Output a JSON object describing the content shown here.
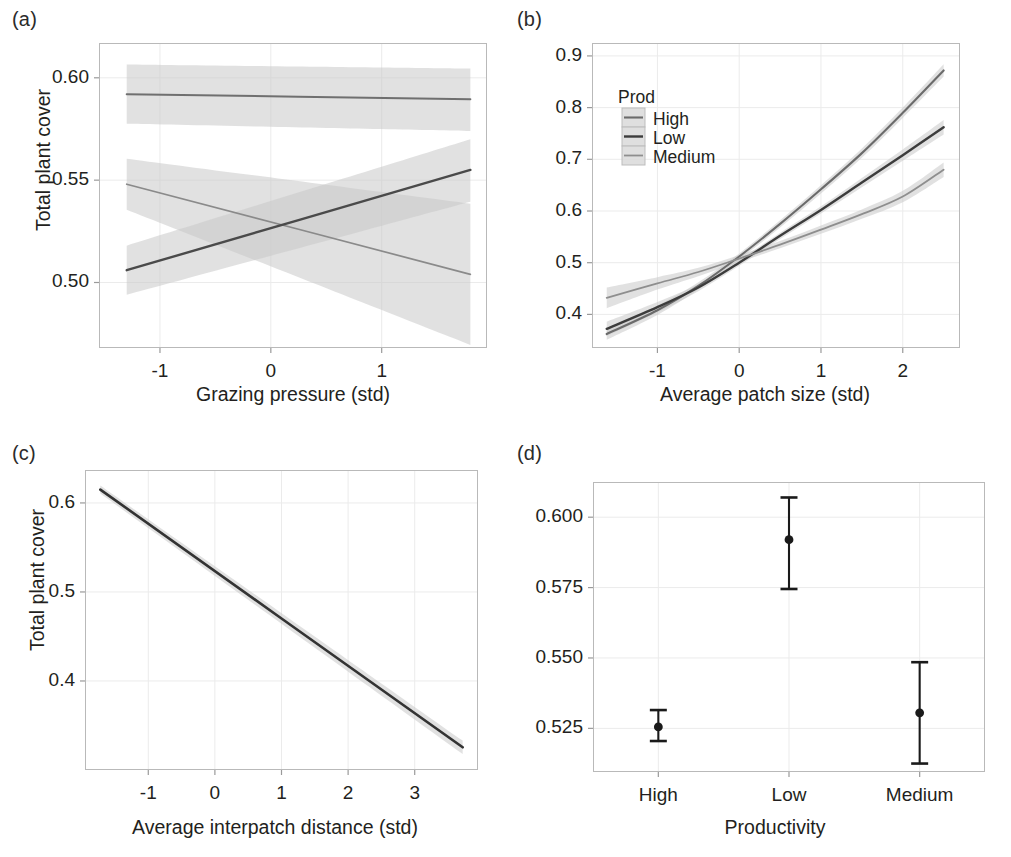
{
  "figure": {
    "background": "#ffffff",
    "panel_border_color": "#b9b9b9",
    "grid_color": "#ebebeb",
    "band_color": "#c9c9c9",
    "tick_color": "#9a9a9a"
  },
  "chart_data": [
    {
      "panel": "a",
      "tag": "(a)",
      "type": "line",
      "title": "",
      "xlabel": "Grazing pressure (std)",
      "ylabel": "Total plant cover",
      "xlim": [
        -1.55,
        1.95
      ],
      "ylim": [
        0.468,
        0.617
      ],
      "xticks": [
        -1,
        0,
        1
      ],
      "xticklabels": [
        "-1",
        "0",
        "1"
      ],
      "yticks": [
        0.5,
        0.55,
        0.6
      ],
      "yticklabels": [
        "0.50",
        "0.55",
        "0.60"
      ],
      "grid": true,
      "legend": "none",
      "series": [
        {
          "name": "Low",
          "color": "#6f6f6f",
          "width": 2.0,
          "x": [
            -1.3,
            1.8
          ],
          "y": [
            0.592,
            0.5895
          ],
          "band_lower": [
            0.5775,
            0.574
          ],
          "band_upper": [
            0.6065,
            0.6045
          ]
        },
        {
          "name": "Medium",
          "color": "#8a8a8a",
          "width": 1.7,
          "x": [
            -1.3,
            1.8
          ],
          "y": [
            0.548,
            0.504
          ],
          "band_lower": [
            0.5355,
            0.4695
          ],
          "band_upper": [
            0.5605,
            0.5385
          ]
        },
        {
          "name": "High",
          "color": "#4a4a4a",
          "width": 2.4,
          "x": [
            -1.3,
            1.8
          ],
          "y": [
            0.506,
            0.555
          ],
          "band_lower": [
            0.494,
            0.5395
          ],
          "band_upper": [
            0.518,
            0.57
          ]
        }
      ]
    },
    {
      "panel": "b",
      "tag": "(b)",
      "type": "line",
      "title": "",
      "xlabel": "Average patch size (std)",
      "ylabel": "",
      "xlim": [
        -1.8,
        2.7
      ],
      "ylim": [
        0.335,
        0.925
      ],
      "xticks": [
        -1,
        0,
        1,
        2
      ],
      "xticklabels": [
        "-1",
        "0",
        "1",
        "2"
      ],
      "yticks": [
        0.4,
        0.5,
        0.6,
        0.7,
        0.8,
        0.9
      ],
      "yticklabels": [
        "0.4",
        "0.5",
        "0.6",
        "0.7",
        "0.8",
        "0.9"
      ],
      "grid": true,
      "legend": {
        "title": "Prod",
        "position": "upper-left-inside",
        "entries": [
          "High",
          "Low",
          "Medium"
        ]
      },
      "series": [
        {
          "name": "High",
          "color": "#6b6b6b",
          "width": 2.1,
          "x": [
            -1.62,
            -1.0,
            -0.5,
            0.0,
            0.5,
            1.0,
            1.5,
            2.0,
            2.5
          ],
          "y": [
            0.362,
            0.408,
            0.455,
            0.512,
            0.575,
            0.642,
            0.712,
            0.79,
            0.872
          ],
          "band_lower": [
            0.351,
            0.399,
            0.448,
            0.506,
            0.568,
            0.634,
            0.703,
            0.78,
            0.86
          ],
          "band_upper": [
            0.373,
            0.417,
            0.462,
            0.518,
            0.582,
            0.65,
            0.721,
            0.8,
            0.884
          ]
        },
        {
          "name": "Low",
          "color": "#3c3c3c",
          "width": 2.4,
          "x": [
            -1.62,
            -1.0,
            -0.5,
            0.0,
            0.5,
            1.0,
            1.5,
            2.0,
            2.5
          ],
          "y": [
            0.372,
            0.414,
            0.452,
            0.5,
            0.552,
            0.602,
            0.655,
            0.708,
            0.762
          ],
          "band_lower": [
            0.358,
            0.404,
            0.445,
            0.494,
            0.546,
            0.595,
            0.646,
            0.697,
            0.748
          ],
          "band_upper": [
            0.386,
            0.424,
            0.459,
            0.506,
            0.558,
            0.609,
            0.664,
            0.719,
            0.776
          ]
        },
        {
          "name": "Medium",
          "color": "#8e8e8e",
          "width": 1.8,
          "x": [
            -1.62,
            -1.0,
            -0.5,
            0.0,
            0.5,
            1.0,
            1.5,
            2.0,
            2.5
          ],
          "y": [
            0.432,
            0.46,
            0.482,
            0.508,
            0.535,
            0.564,
            0.594,
            0.628,
            0.68
          ],
          "band_lower": [
            0.412,
            0.448,
            0.474,
            0.501,
            0.528,
            0.556,
            0.585,
            0.617,
            0.666
          ],
          "band_upper": [
            0.452,
            0.472,
            0.49,
            0.515,
            0.542,
            0.572,
            0.603,
            0.639,
            0.694
          ]
        }
      ]
    },
    {
      "panel": "c",
      "tag": "(c)",
      "type": "line",
      "title": "",
      "xlabel": "Average interpatch distance (std)",
      "ylabel": "Total plant cover",
      "xlim": [
        -1.95,
        3.95
      ],
      "ylim": [
        0.3,
        0.637
      ],
      "xticks": [
        -1,
        0,
        1,
        2,
        3
      ],
      "xticklabels": [
        "-1",
        "0",
        "1",
        "2",
        "3"
      ],
      "yticks": [
        0.4,
        0.5,
        0.6
      ],
      "yticklabels": [
        "0.4",
        "0.5",
        "0.6"
      ],
      "grid": true,
      "legend": "none",
      "series": [
        {
          "name": "fit",
          "color": "#333333",
          "width": 2.6,
          "x": [
            -1.72,
            3.72
          ],
          "y": [
            0.615,
            0.3255
          ],
          "band_lower": [
            0.6105,
            0.318
          ],
          "band_upper": [
            0.6195,
            0.333
          ]
        }
      ]
    },
    {
      "panel": "d",
      "tag": "(d)",
      "type": "scatter",
      "title": "",
      "xlabel": "Productivity",
      "ylabel": "",
      "categories": [
        "High",
        "Low",
        "Medium"
      ],
      "ylim": [
        0.5095,
        0.6125
      ],
      "yticks": [
        0.525,
        0.55,
        0.575,
        0.6
      ],
      "yticklabels": [
        "0.525",
        "0.550",
        "0.575",
        "0.600"
      ],
      "grid": true,
      "legend": "none",
      "point_color": "#1a1a1a",
      "values": [
        0.5255,
        0.592,
        0.5305
      ],
      "error_low": [
        0.5205,
        0.5745,
        0.5125
      ],
      "error_high": [
        0.5315,
        0.607,
        0.5485
      ]
    }
  ]
}
